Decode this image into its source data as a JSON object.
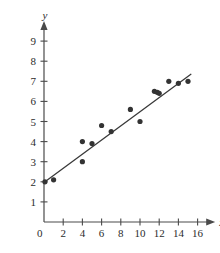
{
  "chart_data": {
    "type": "scatter",
    "title": "",
    "xlabel": "x",
    "ylabel": "y",
    "xlim": [
      0,
      17
    ],
    "ylim": [
      0,
      9.6
    ],
    "grid": false,
    "legend": null,
    "x_ticks": [
      0,
      2,
      4,
      6,
      8,
      10,
      12,
      14,
      16
    ],
    "y_ticks": [
      1,
      2,
      3,
      4,
      5,
      6,
      7,
      8,
      9
    ],
    "x_tick_labels": [
      "0",
      "2",
      "4",
      "6",
      "8",
      "10",
      "12",
      "14",
      "16"
    ],
    "y_tick_labels": [
      "1",
      "2",
      "3",
      "4",
      "5",
      "6",
      "7",
      "8",
      "9"
    ],
    "origin_label": "0",
    "points": [
      {
        "x": 0.1,
        "y": 2.0
      },
      {
        "x": 1.0,
        "y": 2.1
      },
      {
        "x": 4.0,
        "y": 4.0
      },
      {
        "x": 4.0,
        "y": 3.0
      },
      {
        "x": 5.0,
        "y": 3.9
      },
      {
        "x": 6.0,
        "y": 4.8
      },
      {
        "x": 7.0,
        "y": 4.5
      },
      {
        "x": 9.0,
        "y": 5.6
      },
      {
        "x": 10.0,
        "y": 5.0
      },
      {
        "x": 11.5,
        "y": 6.5
      },
      {
        "x": 11.8,
        "y": 6.45
      },
      {
        "x": 12.0,
        "y": 6.4
      },
      {
        "x": 13.0,
        "y": 7.0
      },
      {
        "x": 14.0,
        "y": 6.9
      },
      {
        "x": 15.0,
        "y": 7.0
      }
    ],
    "fit_line": {
      "label": "regression line",
      "x_start": 0.1,
      "y_start": 2.0,
      "x_end": 15.3,
      "y_end": 7.35
    },
    "colors": {
      "point": "#333333",
      "line": "#3a3a3a",
      "axis": "#4a4a4a",
      "text": "#2b2b2b",
      "background": "#ffffff"
    }
  }
}
